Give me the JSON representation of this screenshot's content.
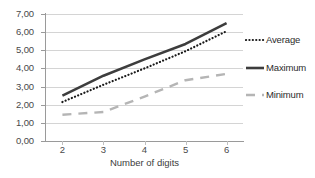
{
  "chart_data": {
    "type": "line",
    "title": "",
    "subtitle": "",
    "xlabel": "Number of digits",
    "ylabel": "",
    "x": [
      2,
      3,
      4,
      5,
      6
    ],
    "xlim": [
      1.6,
      6.4
    ],
    "ylim": [
      0,
      7
    ],
    "xtick_labels": [
      "2",
      "3",
      "4",
      "5",
      "6"
    ],
    "ytick_labels": [
      "0,00",
      "1,00",
      "2,00",
      "3,00",
      "4,00",
      "5,00",
      "6,00",
      "7,00"
    ],
    "ytick_values": [
      0,
      1,
      2,
      3,
      4,
      5,
      6,
      7
    ],
    "grid": "horizontal",
    "legend_position": "right-outside",
    "decimal_separator": ",",
    "series": [
      {
        "name": "Average",
        "style": "dotted",
        "color": "#1a1a1a",
        "values": [
          2.15,
          3.1,
          4.0,
          4.95,
          6.05
        ]
      },
      {
        "name": "Maximum",
        "style": "solid-thick",
        "color": "#3d3d3d",
        "values": [
          2.5,
          3.6,
          4.5,
          5.35,
          6.5
        ]
      },
      {
        "name": "Minimum",
        "style": "dashed",
        "color": "#b5b5b5",
        "values": [
          1.45,
          1.6,
          2.45,
          3.35,
          3.7
        ]
      }
    ]
  },
  "axes": {
    "axis_line_color": "#9a9a9a",
    "gridline_color": "#d4d4d4",
    "tick_label_color": "#4a4a4a"
  },
  "legend": {
    "entries": [
      {
        "label": "Average",
        "series": "Average"
      },
      {
        "label": "Maximum",
        "series": "Maximum"
      },
      {
        "label": "Minimum",
        "series": "Minimum"
      }
    ]
  }
}
